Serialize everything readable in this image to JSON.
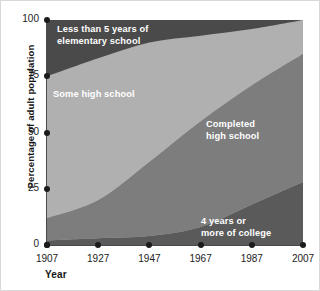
{
  "chart_data": {
    "type": "area",
    "stacked": true,
    "title": "",
    "xlabel": "Year",
    "ylabel": "Percentage of adult population",
    "xlim": [
      1907,
      2007
    ],
    "ylim": [
      0,
      100
    ],
    "grid": false,
    "legend": "inline-labels",
    "x": [
      1907,
      1927,
      1947,
      1967,
      1987,
      2007
    ],
    "xticks": [
      "1907",
      "1927",
      "1947",
      "1967",
      "1987",
      "2007"
    ],
    "yticks": [
      "0",
      "25",
      "50",
      "75",
      "100"
    ],
    "ytick_values": [
      0,
      25,
      50,
      75,
      100
    ],
    "series": [
      {
        "name": "4 years or more of college",
        "color": "#5a5a5a",
        "values": [
          2,
          3,
          4,
          8,
          18,
          28
        ]
      },
      {
        "name": "Completed high school",
        "color": "#7d7d7d",
        "values": [
          10,
          17,
          33,
          47,
          53,
          57
        ]
      },
      {
        "name": "Some high school",
        "color": "#b0b0b0",
        "values": [
          63,
          63,
          53,
          38,
          25,
          15
        ]
      },
      {
        "name": "Less than 5 years of elementary school",
        "color": "#4a4a4a",
        "values": [
          25,
          17,
          10,
          7,
          4,
          0
        ]
      }
    ]
  },
  "axes": {
    "y_title": "Percentage of adult population",
    "x_title": "Year"
  },
  "captions": {
    "elementary_line1": "Less than 5 years of",
    "elementary_line2": "elementary school",
    "some_high_school": "Some high school",
    "completed_line1": "Completed",
    "completed_line2": "high school",
    "college_line1": "4 years or",
    "college_line2": "more of college"
  }
}
